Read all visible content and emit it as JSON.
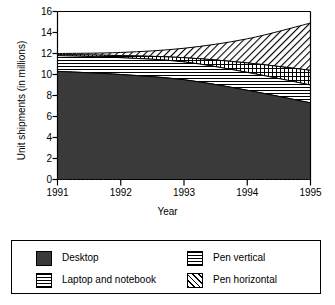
{
  "chart_data": {
    "type": "area",
    "stacked": true,
    "title": "",
    "xlabel": "Year",
    "ylabel": "Unit shipments (in millions)",
    "x": [
      1991,
      1992,
      1993,
      1994,
      1995
    ],
    "xtick_labels": [
      "1991",
      "1992",
      "1993",
      "1994",
      "1995"
    ],
    "xlim": [
      1991,
      1995
    ],
    "ylim": [
      0,
      16
    ],
    "ytick_labels": [
      "0",
      "2",
      "4",
      "6",
      "8",
      "10",
      "12",
      "14",
      "16"
    ],
    "ytick_values": [
      0,
      2,
      4,
      6,
      8,
      10,
      12,
      14,
      16
    ],
    "grid": false,
    "legend_position": "below",
    "series": [
      {
        "name": "Desktop",
        "pattern": "solid-dark",
        "color": "#3a3a3a",
        "values": [
          10.3,
          10.0,
          9.5,
          8.5,
          7.3
        ]
      },
      {
        "name": "Laptop and notebook",
        "pattern": "horizontal-lines",
        "color": "#ffffff",
        "values": [
          1.5,
          1.6,
          1.7,
          1.7,
          1.7
        ]
      },
      {
        "name": "Pen vertical",
        "pattern": "grid",
        "color": "#ffffff",
        "values": [
          0.1,
          0.2,
          0.4,
          0.9,
          1.4
        ]
      },
      {
        "name": "Pen horizontal",
        "pattern": "diagonal-lines",
        "color": "#ffffff",
        "values": [
          0.1,
          0.3,
          0.9,
          2.3,
          4.5
        ]
      }
    ],
    "cumulative_tops": {
      "Desktop": [
        10.3,
        10.0,
        9.5,
        8.5,
        7.3
      ],
      "Laptop and notebook": [
        11.8,
        11.6,
        11.2,
        10.2,
        9.0
      ],
      "Pen vertical": [
        11.9,
        11.8,
        11.6,
        11.1,
        10.4
      ],
      "Pen horizontal": [
        12.0,
        12.1,
        12.5,
        13.4,
        14.9
      ]
    },
    "annotations": []
  },
  "legend": {
    "items": [
      {
        "label": "Desktop"
      },
      {
        "label": "Laptop and notebook"
      },
      {
        "label": "Pen vertical"
      },
      {
        "label": "Pen horizontal"
      }
    ]
  }
}
